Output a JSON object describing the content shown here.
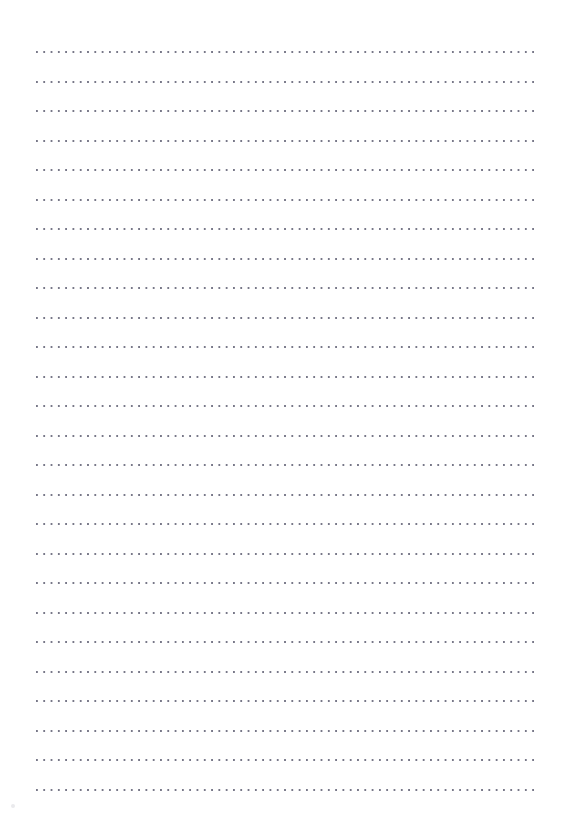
{
  "page": {
    "kind": "dotted-ruled-writing-paper",
    "title": "",
    "width_px": 572,
    "height_px": 827,
    "background_color": "#ffffff",
    "has_text_content": false,
    "header_text": "",
    "footer_text": ""
  },
  "paper": {
    "orientation": "portrait",
    "margin_left_px": 36,
    "margin_right_px": 36,
    "margin_top_px": 52,
    "margin_bottom_px": 37
  },
  "ruling": {
    "style": "dotted",
    "line_count": 26,
    "first_line_y": 52,
    "line_spacing_px": 29.5,
    "line_start_x": 36,
    "line_end_x": 536,
    "line_length_px": 500,
    "dot_spacing_px": 7.3,
    "dot_diameter_px": 1.7,
    "dot_color": "#6c6c7e",
    "dot_opacity": 0.92,
    "lines": [
      {
        "index": 1,
        "y": 52,
        "text": ""
      },
      {
        "index": 2,
        "y": 82,
        "text": ""
      },
      {
        "index": 3,
        "y": 111,
        "text": ""
      },
      {
        "index": 4,
        "y": 141,
        "text": ""
      },
      {
        "index": 5,
        "y": 170,
        "text": ""
      },
      {
        "index": 6,
        "y": 200,
        "text": ""
      },
      {
        "index": 7,
        "y": 229,
        "text": ""
      },
      {
        "index": 8,
        "y": 259,
        "text": ""
      },
      {
        "index": 9,
        "y": 288,
        "text": ""
      },
      {
        "index": 10,
        "y": 318,
        "text": ""
      },
      {
        "index": 11,
        "y": 347,
        "text": ""
      },
      {
        "index": 12,
        "y": 377,
        "text": ""
      },
      {
        "index": 13,
        "y": 406,
        "text": ""
      },
      {
        "index": 14,
        "y": 436,
        "text": ""
      },
      {
        "index": 15,
        "y": 465,
        "text": ""
      },
      {
        "index": 16,
        "y": 495,
        "text": ""
      },
      {
        "index": 17,
        "y": 524,
        "text": ""
      },
      {
        "index": 18,
        "y": 554,
        "text": ""
      },
      {
        "index": 19,
        "y": 583,
        "text": ""
      },
      {
        "index": 20,
        "y": 613,
        "text": ""
      },
      {
        "index": 21,
        "y": 642,
        "text": ""
      },
      {
        "index": 22,
        "y": 672,
        "text": ""
      },
      {
        "index": 23,
        "y": 701,
        "text": ""
      },
      {
        "index": 24,
        "y": 731,
        "text": ""
      },
      {
        "index": 25,
        "y": 760,
        "text": ""
      },
      {
        "index": 26,
        "y": 790,
        "text": ""
      }
    ]
  },
  "artifacts": {
    "corner_speck": {
      "present": true,
      "x": 11,
      "y": 804,
      "color": "#9696a5"
    }
  }
}
